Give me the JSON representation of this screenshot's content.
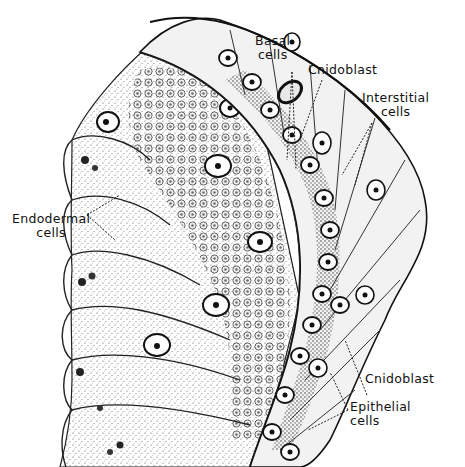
{
  "figure": {
    "colors": {
      "ink": "#111111",
      "paper": "#ffffff",
      "stipple": "#555555",
      "shade": "#3a3a3a"
    }
  },
  "labels": {
    "basal": {
      "line1": "Basal",
      "line2": "cells"
    },
    "cnidoblast_top": {
      "line1": "Cnidoblast"
    },
    "interstitial": {
      "line1": "Interstitial",
      "line2": "cells"
    },
    "endodermal": {
      "line1": "Endodermal",
      "line2": "cells"
    },
    "cnidoblast_bottom": {
      "line1": "Cnidoblast"
    },
    "epithelial": {
      "line1": "Epithelial",
      "line2": "cells"
    }
  }
}
